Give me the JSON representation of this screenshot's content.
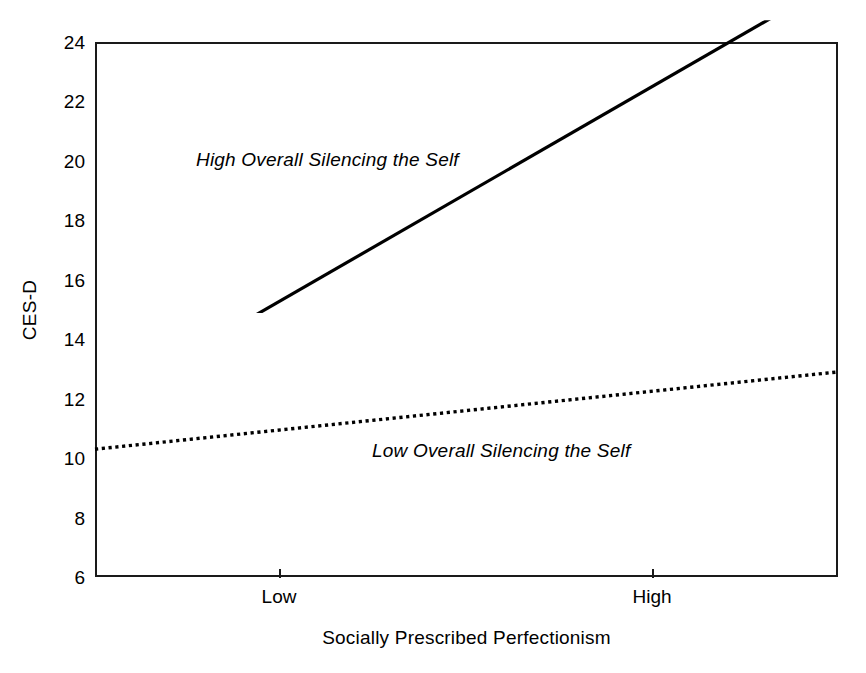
{
  "chart_data": {
    "type": "line",
    "title": "",
    "subtitle": "",
    "xlabel": "Socially Prescribed Perfectionism",
    "ylabel": "CES-D",
    "xlim": [
      0,
      1
    ],
    "ylim": [
      6,
      24
    ],
    "grid": false,
    "legend_position": "inline-annotation",
    "x_tick_labels": [
      "Low",
      "High"
    ],
    "x_tick_positions": [
      0.2476,
      0.7497
    ],
    "y_tick_labels": [
      "6",
      "8",
      "10",
      "12",
      "14",
      "16",
      "18",
      "20",
      "22",
      "24"
    ],
    "y_tick_values": [
      6,
      8,
      10,
      12,
      14,
      16,
      18,
      20,
      22,
      24
    ],
    "series": [
      {
        "name": "High Overall Silencing the Self",
        "style": "solid",
        "color": "#000000",
        "width": 3,
        "x": [
          0,
          1
        ],
        "values": [
          11.7,
          26.1
        ],
        "endpoints_note": "line exits top of frame (CES-D = 24) before right edge",
        "annotation": "High Overall Silencing the Self"
      },
      {
        "name": "Low Overall Silencing the Self",
        "style": "dotted",
        "color": "#000000",
        "width": 3,
        "x": [
          0,
          1
        ],
        "values": [
          10.3,
          12.9
        ],
        "annotation": "Low Overall Silencing the Self"
      }
    ],
    "annotations": [
      {
        "text": "High Overall Silencing the Self",
        "x": 0.14,
        "y": 20.3,
        "style": "italic"
      },
      {
        "text": "Low Overall Silencing the Self",
        "x": 0.38,
        "y": 10.6,
        "style": "italic"
      }
    ]
  },
  "axes": {
    "y_title": "CES-D",
    "x_title": "Socially Prescribed Perfectionism",
    "y_ticks": [
      {
        "label": "24",
        "value": 24
      },
      {
        "label": "22",
        "value": 22
      },
      {
        "label": "20",
        "value": 20
      },
      {
        "label": "18",
        "value": 18
      },
      {
        "label": "16",
        "value": 16
      },
      {
        "label": "14",
        "value": 14
      },
      {
        "label": "12",
        "value": 12
      },
      {
        "label": "10",
        "value": 10
      },
      {
        "label": "8",
        "value": 8
      },
      {
        "label": "6",
        "value": 6
      }
    ],
    "x_ticks": [
      {
        "label": "Low",
        "pos": 0.2476
      },
      {
        "label": "High",
        "pos": 0.7497
      }
    ]
  },
  "colors": {
    "axis": "#1a1a1a",
    "line": "#000000",
    "background": "#ffffff"
  }
}
